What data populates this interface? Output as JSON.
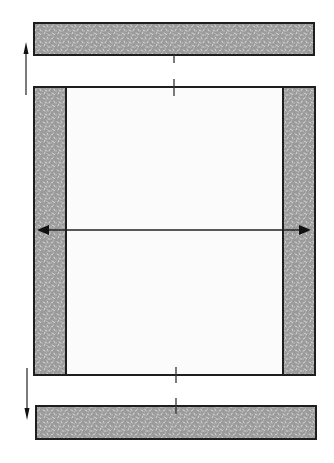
{
  "diagram": {
    "colors": {
      "border_fill": "#9b9b9b",
      "speckle": "#d6d6d6",
      "outline": "#1e1e1e",
      "center_fill": "#fbfbfb",
      "arrow": "#222222"
    },
    "top_border": {
      "x": 34,
      "y": 23,
      "w": 280,
      "h": 32
    },
    "bottom_border": {
      "x": 36,
      "y": 406,
      "w": 280,
      "h": 33
    },
    "center_panel": {
      "x": 34,
      "y": 87,
      "w": 281,
      "h": 288
    },
    "left_border": {
      "x": 34,
      "y": 87,
      "w": 32,
      "h": 288
    },
    "right_border": {
      "x": 283,
      "y": 87,
      "w": 32,
      "h": 288
    },
    "arrows": {
      "up": {
        "x": 26,
        "y1": 95,
        "y2": 42
      },
      "down": {
        "x": 27,
        "y1": 368,
        "y2": 420
      },
      "horizontal": {
        "y": 230,
        "x1": 37,
        "x2": 311
      }
    },
    "center_marks": [
      {
        "x": 174,
        "y1": 55,
        "y2": 63
      },
      {
        "x": 174,
        "y1": 79,
        "y2": 96
      },
      {
        "x": 176,
        "y1": 367,
        "y2": 383
      },
      {
        "x": 176,
        "y1": 398,
        "y2": 414
      }
    ]
  }
}
